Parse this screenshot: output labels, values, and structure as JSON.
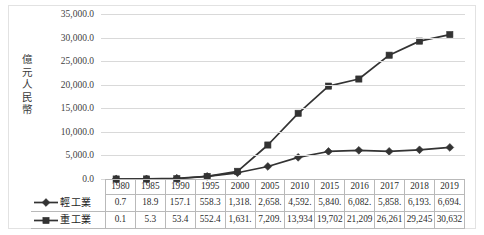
{
  "chart_data": {
    "type": "line",
    "title": "",
    "xlabel": "",
    "ylabel": "億元人民幣",
    "ylim": [
      0,
      35000
    ],
    "ytick_step": 5000,
    "grid": true,
    "legend_position": "table-row-headers",
    "categories": [
      "1980",
      "1985",
      "1990",
      "1995",
      "2000",
      "2005",
      "2010",
      "2015",
      "2016",
      "2017",
      "2018",
      "2019"
    ],
    "ytick_labels": [
      "35,000.0",
      "30,000.0",
      "25,000.0",
      "20,000.0",
      "15,000.0",
      "10,000.0",
      "5,000.0",
      "0.0"
    ],
    "ytick_values": [
      35000,
      30000,
      25000,
      20000,
      15000,
      10000,
      5000,
      0
    ],
    "series": [
      {
        "name": "輕工業",
        "marker": "diamond",
        "color": "#333333",
        "values": [
          0.7,
          18.9,
          157.1,
          558.3,
          1318.0,
          2658.0,
          4592.0,
          5840.0,
          6082.0,
          5858.0,
          6193.0,
          6694.0
        ],
        "display_values": [
          "0.7",
          "18.9",
          "157.1",
          "558.3",
          "1,318.",
          "2,658.",
          "4,592.",
          "5,840.",
          "6,082.",
          "5,858.",
          "6,193.",
          "6,694."
        ]
      },
      {
        "name": "重工業",
        "marker": "square",
        "color": "#333333",
        "values": [
          0.1,
          5.3,
          53.4,
          552.4,
          1631.0,
          7209.0,
          13934.0,
          19702.0,
          21209.0,
          26261.0,
          29245.0,
          30632.0
        ],
        "display_values": [
          "0.1",
          "5.3",
          "53.4",
          "552.4",
          "1,631.",
          "7,209.",
          "13,934",
          "19,702",
          "21,209",
          "26,261",
          "29,245",
          "30,632"
        ]
      }
    ]
  },
  "table": {
    "header_row": [
      "1980",
      "1985",
      "1990",
      "1995",
      "2000",
      "2005",
      "2010",
      "2015",
      "2016",
      "2017",
      "2018",
      "2019"
    ],
    "rows": [
      {
        "label": "輕工業",
        "cells": [
          "0.7",
          "18.9",
          "157.1",
          "558.3",
          "1,318.",
          "2,658.",
          "4,592.",
          "5,840.",
          "6,082.",
          "5,858.",
          "6,193.",
          "6,694."
        ]
      },
      {
        "label": "重工業",
        "cells": [
          "0.1",
          "5.3",
          "53.4",
          "552.4",
          "1,631.",
          "7,209.",
          "13,934",
          "19,702",
          "21,209",
          "26,261",
          "29,245",
          "30,632"
        ]
      }
    ]
  },
  "axis": {
    "y_title_chars": [
      "億",
      "元",
      "人",
      "民",
      "幣"
    ]
  },
  "colors": {
    "series_line": "#333333",
    "gridline": "#d9d9d9",
    "table_border": "#b9b9b9",
    "frame": "#e2e2e2",
    "text": "#2b2b2b"
  }
}
